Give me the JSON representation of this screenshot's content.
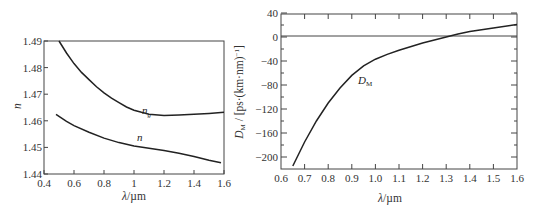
{
  "chart_data": [
    {
      "type": "line",
      "title": "",
      "xlabel": "λ/µm",
      "ylabel": "n",
      "xlim": [
        0.4,
        1.6
      ],
      "ylim": [
        1.44,
        1.49
      ],
      "x_ticks": [
        "0.4",
        "0.6",
        "0.8",
        "1",
        "1.2",
        "1.4",
        "1.6"
      ],
      "y_ticks": [
        "1.44",
        "1.45",
        "1.46",
        "1.47",
        "1.48",
        "1.49"
      ],
      "grid": false,
      "series": [
        {
          "name": "n_g",
          "label": "n",
          "label_sub": "g",
          "x": [
            0.5,
            0.55,
            0.6,
            0.65,
            0.7,
            0.75,
            0.8,
            0.85,
            0.9,
            0.95,
            1.0,
            1.05,
            1.1,
            1.2,
            1.3,
            1.4,
            1.5,
            1.6
          ],
          "values": [
            1.49,
            1.4855,
            1.4815,
            1.4782,
            1.4755,
            1.4728,
            1.4705,
            1.4685,
            1.4668,
            1.4652,
            1.464,
            1.4632,
            1.4625,
            1.462,
            1.4622,
            1.4625,
            1.4628,
            1.4632
          ]
        },
        {
          "name": "n",
          "label": "n",
          "x": [
            0.48,
            0.55,
            0.6,
            0.7,
            0.8,
            0.9,
            1.0,
            1.1,
            1.2,
            1.3,
            1.4,
            1.5,
            1.58
          ],
          "values": [
            1.4624,
            1.4598,
            1.4582,
            1.4557,
            1.4535,
            1.4518,
            1.4505,
            1.4497,
            1.4488,
            1.4478,
            1.4466,
            1.4452,
            1.4442
          ]
        }
      ]
    },
    {
      "type": "line",
      "title": "",
      "xlabel": "λ/µm",
      "ylabel": "D_M / [ps·(km·nm)^-1]",
      "xlim": [
        0.6,
        1.6
      ],
      "ylim": [
        -220,
        40
      ],
      "x_ticks": [
        "0.6",
        "0.7",
        "0.8",
        "0.9",
        "1.0",
        "1.1",
        "1.2",
        "1.3",
        "1.4",
        "1.5",
        "1.6"
      ],
      "y_ticks": [
        "40",
        "0",
        "-40",
        "-80",
        "-120",
        "-160",
        "-200"
      ],
      "grid": false,
      "zero_line": true,
      "series": [
        {
          "name": "D_M",
          "label": "D",
          "label_sub": "M",
          "x": [
            0.65,
            0.7,
            0.75,
            0.8,
            0.85,
            0.9,
            0.95,
            1.0,
            1.05,
            1.1,
            1.2,
            1.3,
            1.35,
            1.4,
            1.5,
            1.6
          ],
          "values": [
            -215,
            -175,
            -140,
            -110,
            -85,
            -64,
            -48,
            -37,
            -29,
            -22,
            -10,
            0,
            5,
            9,
            15,
            21
          ]
        }
      ]
    }
  ],
  "left": {
    "ylabel": "n",
    "xlabel_lambda": "λ",
    "xlabel_unit": "/µm",
    "curve_ng_main": "n",
    "curve_ng_sub": "g",
    "curve_n": "n"
  },
  "right": {
    "ylabel_D": "D",
    "ylabel_sub": "M",
    "ylabel_rest": " / [ps·(km·nm)",
    "ylabel_sup": "−1",
    "ylabel_close": "]",
    "xlabel_lambda": "λ",
    "xlabel_unit": "/µm",
    "curve_main": "D",
    "curve_sub": "M"
  }
}
